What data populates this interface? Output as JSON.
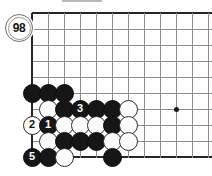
{
  "figure": {
    "kind": "go-board-diagram",
    "caption_marker": "98",
    "board": {
      "origin_x": 32,
      "origin_y": 13,
      "spacing": 16,
      "cols": 11,
      "rows": 10,
      "line_color": "#8c8c8c",
      "border_color": "#262626",
      "background": "#ffffff"
    },
    "star_points": [
      {
        "name": "hoshi-right",
        "col": 9,
        "row": 6
      }
    ],
    "stones": [
      {
        "name": "stone-c0-r5",
        "col": 0,
        "row": 5,
        "color": "black",
        "label": ""
      },
      {
        "name": "stone-c1-r5",
        "col": 1,
        "row": 5,
        "color": "black",
        "label": ""
      },
      {
        "name": "stone-c2-r5",
        "col": 2,
        "row": 5,
        "color": "black",
        "label": ""
      },
      {
        "name": "stone-c1-r6",
        "col": 1,
        "row": 6,
        "color": "white",
        "label": ""
      },
      {
        "name": "stone-c2-r6",
        "col": 2,
        "row": 6,
        "color": "black",
        "label": ""
      },
      {
        "name": "stone-c3-r6",
        "col": 3,
        "row": 6,
        "color": "black",
        "label": "3"
      },
      {
        "name": "stone-c4-r6",
        "col": 4,
        "row": 6,
        "color": "black",
        "label": ""
      },
      {
        "name": "stone-c5-r6",
        "col": 5,
        "row": 6,
        "color": "black",
        "label": ""
      },
      {
        "name": "stone-c6-r6",
        "col": 6,
        "row": 6,
        "color": "white",
        "label": ""
      },
      {
        "name": "stone-c0-r7",
        "col": 0,
        "row": 7,
        "color": "white",
        "label": "2"
      },
      {
        "name": "stone-c1-r7",
        "col": 1,
        "row": 7,
        "color": "black",
        "label": "1"
      },
      {
        "name": "stone-c2-r7",
        "col": 2,
        "row": 7,
        "color": "white",
        "label": ""
      },
      {
        "name": "stone-c3-r7",
        "col": 3,
        "row": 7,
        "color": "white",
        "label": ""
      },
      {
        "name": "stone-c4-r7",
        "col": 4,
        "row": 7,
        "color": "white",
        "label": ""
      },
      {
        "name": "stone-c5-r7",
        "col": 5,
        "row": 7,
        "color": "black",
        "label": ""
      },
      {
        "name": "stone-c6-r7",
        "col": 6,
        "row": 7,
        "color": "white",
        "label": ""
      },
      {
        "name": "stone-c1-r8",
        "col": 1,
        "row": 8,
        "color": "white",
        "label": ""
      },
      {
        "name": "stone-c2-r8",
        "col": 2,
        "row": 8,
        "color": "black",
        "label": ""
      },
      {
        "name": "stone-c3-r8",
        "col": 3,
        "row": 8,
        "color": "black",
        "label": ""
      },
      {
        "name": "stone-c4-r8",
        "col": 4,
        "row": 8,
        "color": "black",
        "label": ""
      },
      {
        "name": "stone-c5-r8",
        "col": 5,
        "row": 8,
        "color": "white",
        "label": ""
      },
      {
        "name": "stone-c6-r8",
        "col": 6,
        "row": 8,
        "color": "white",
        "label": ""
      },
      {
        "name": "stone-c0-r9",
        "col": 0,
        "row": 9,
        "color": "black",
        "label": "5"
      },
      {
        "name": "stone-c1-r9",
        "col": 1,
        "row": 9,
        "color": "black",
        "label": ""
      },
      {
        "name": "stone-c2-r9",
        "col": 2,
        "row": 9,
        "color": "white",
        "label": ""
      },
      {
        "name": "stone-c5-r9",
        "col": 5,
        "row": 9,
        "color": "black",
        "label": ""
      }
    ]
  }
}
